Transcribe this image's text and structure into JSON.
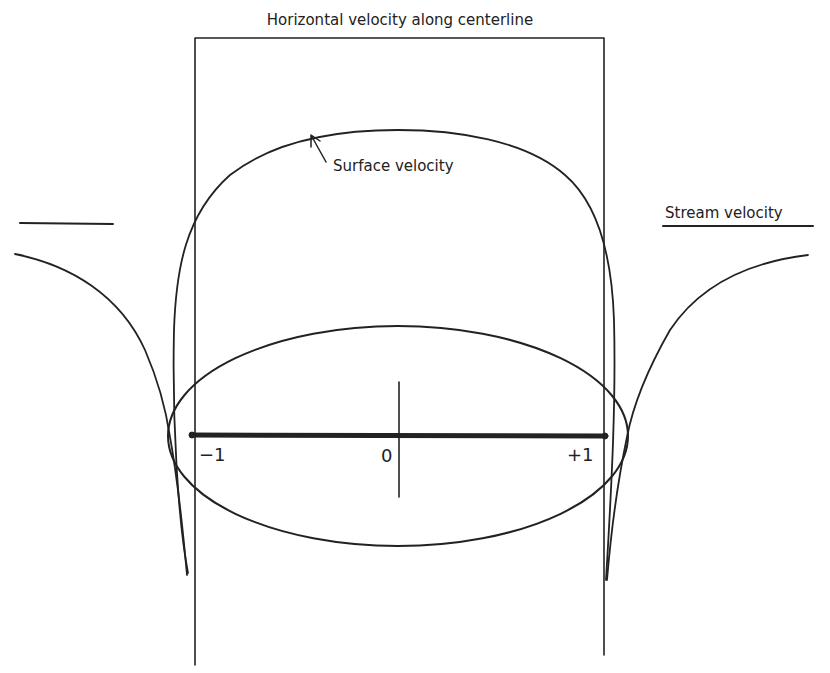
{
  "diagram": {
    "title": "Horizontal velocity along centerline",
    "labels": {
      "surface_velocity": "Surface velocity",
      "stream_velocity": "Stream velocity",
      "tick_minus_one": "−1",
      "tick_zero": "0",
      "tick_plus_one": "+1"
    },
    "colors": {
      "ink": "#222222",
      "background": "#ffffff"
    },
    "elements": [
      "frame-box",
      "ellipse-body",
      "centerline-axis",
      "surface-velocity-curve",
      "centerline-velocity-curves",
      "stream-velocity-reference-lines"
    ]
  }
}
